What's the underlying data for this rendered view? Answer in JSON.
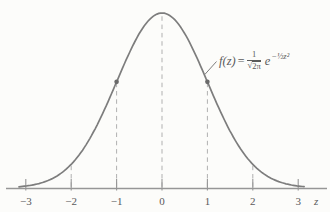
{
  "chart_data": {
    "type": "line",
    "xlabel": "z",
    "ylabel": "",
    "x_ticks": [
      -3,
      -2,
      -1,
      0,
      1,
      2,
      3
    ],
    "x_tick_labels": [
      "−3",
      "−2",
      "−1",
      "0",
      "1",
      "2",
      "3"
    ],
    "xlim": [
      -3.45,
      3.65
    ],
    "ylim": [
      0,
      0.42
    ],
    "grid": false,
    "legend": false,
    "series": [
      {
        "name": "f(z)",
        "function": "f(z) = (1/√(2π)) e^(−z²/2)",
        "x_range": [
          -3.15,
          3.15
        ],
        "peak": {
          "z": 0,
          "f": 0.3989
        }
      }
    ],
    "dashed_guides_x": [
      -2,
      -1,
      0,
      1,
      2
    ],
    "marked_points": [
      {
        "z": -1,
        "f": 0.242
      },
      {
        "z": 1,
        "f": 0.242
      }
    ],
    "annotation": {
      "text": "f(z) = 1/√2π e^(−½z²)",
      "lhs": "f(z)",
      "equals": "=",
      "frac_num": "1",
      "radical": "√",
      "frac_den": "2π",
      "exp_base": "e",
      "exponent": "−½z²",
      "points_to": {
        "z": 0.93
      }
    }
  },
  "colors": {
    "background": "#fcfcfa",
    "curve": "#7d7d7d",
    "axis": "#969696",
    "dash": "#b0b0b0",
    "dot": "#6a6a6a",
    "text": "#5a5a5a"
  }
}
